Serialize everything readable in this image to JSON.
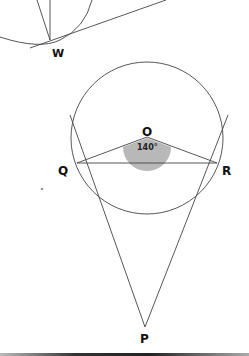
{
  "diagram": {
    "labels": {
      "w": "W",
      "o": "O",
      "q": "Q",
      "r": "R",
      "p": "P"
    },
    "angle_label": "140°",
    "angle_fill": "#b8b8b8",
    "line_color": "#444444",
    "upper_figure": {
      "point": "W",
      "description": "circle with tangent line at W and two chords from W"
    },
    "lower_figure": {
      "center": "O",
      "tangent_points": [
        "Q",
        "R"
      ],
      "external_point": "P",
      "angle_QOR": 140
    }
  }
}
